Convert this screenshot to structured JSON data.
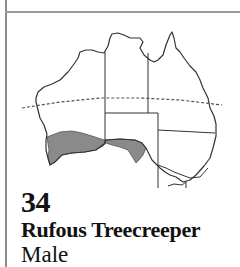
{
  "card": {
    "number": "34",
    "species_name": "Rufous Treecreeper",
    "sex": "Male"
  },
  "map": {
    "region": "Australia",
    "legend_icon": "distribution-map-icon",
    "shaded_color": "#8a8a8a",
    "outline_color": "#333333",
    "tropic_line": "dashed"
  }
}
